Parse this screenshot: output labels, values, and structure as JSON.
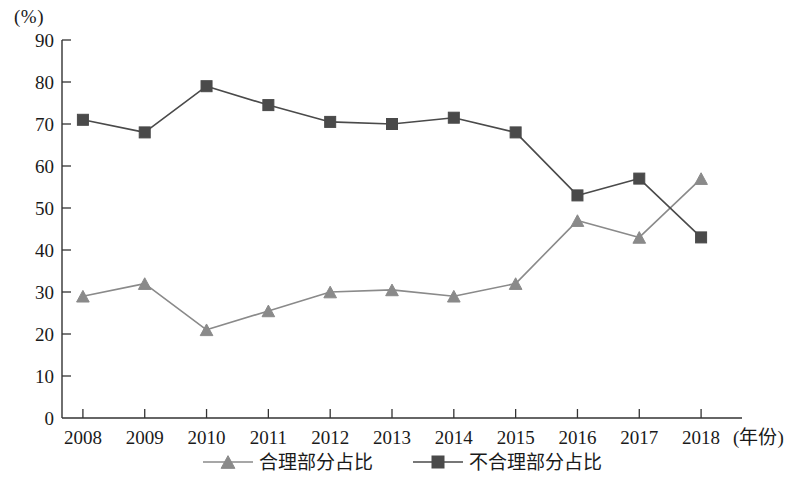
{
  "chart_data": {
    "type": "line",
    "title": "",
    "xlabel": "(年份)",
    "ylabel": "(%)",
    "ylim": [
      0,
      90
    ],
    "grid": false,
    "legend_position": "bottom-center",
    "categories": [
      "2008",
      "2009",
      "2010",
      "2011",
      "2012",
      "2013",
      "2014",
      "2015",
      "2016",
      "2017",
      "2018"
    ],
    "y_ticks": [
      "0",
      "10",
      "20",
      "30",
      "40",
      "50",
      "60",
      "70",
      "80",
      "90"
    ],
    "series": [
      {
        "name": "合理部分占比",
        "marker": "triangle",
        "color": "#8a8a8a",
        "values": [
          29,
          32,
          21,
          25.5,
          30,
          30.5,
          29,
          32,
          47,
          43,
          57
        ]
      },
      {
        "name": "不合理部分占比",
        "marker": "square",
        "color": "#4a4a4a",
        "values": [
          71,
          68,
          79,
          74.5,
          70.5,
          70,
          71.5,
          68,
          53,
          57,
          43
        ]
      }
    ]
  },
  "axis": {
    "unit_label": "(%)",
    "x_axis_title": "(年份)"
  },
  "legend": {
    "items": [
      {
        "label": "合理部分占比",
        "marker": "triangle-marker-icon"
      },
      {
        "label": "不合理部分占比",
        "marker": "square-marker-icon"
      }
    ]
  }
}
